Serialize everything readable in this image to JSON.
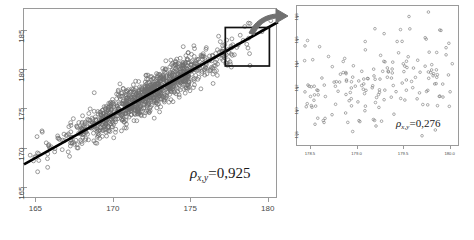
{
  "figure": {
    "title": "",
    "background": "#ffffff",
    "point_color": "#6e6e6e",
    "line_color": "#000000",
    "frame_color": "#9a9a9a",
    "arrow_color": "#707070",
    "highlight_color": "#111111"
  },
  "left_panel": {
    "name": "full-scatter-panel",
    "rho_symbol": "ρ",
    "rho_subscript": "x,y",
    "rho_equals": "=0,925",
    "x_ticks": [
      "165",
      "170",
      "175",
      "180"
    ],
    "y_ticks": [
      "165",
      "170",
      "175",
      "180",
      "185"
    ],
    "highlight_box": {
      "x0": 177.2,
      "x1": 180.0,
      "y0": 180.6,
      "y1": 185.4
    }
  },
  "right_panel": {
    "name": "zoomed-scatter-panel",
    "rho_symbol": "ρ",
    "rho_subscript": "x,y",
    "rho_equals": "=0,276",
    "x_ticks": [
      "178.5",
      "179.0",
      "179.5",
      "180.0"
    ],
    "y_ticks": [
      "178",
      "180",
      "182",
      "184",
      "186",
      "188"
    ]
  },
  "chart_data": [
    {
      "type": "scatter",
      "id": "left-full-scatter",
      "title": "",
      "xlabel": "",
      "ylabel": "",
      "xlim": [
        164.2,
        180.6
      ],
      "ylim": [
        163.6,
        187.8
      ],
      "xticks": [
        165,
        170,
        175,
        180
      ],
      "yticks": [
        165,
        170,
        175,
        180,
        185
      ],
      "grid": false,
      "legend": null,
      "correlation": 0.925,
      "n_points": 1100,
      "marker": "open-circle",
      "marker_size": 3.0,
      "point_color": "#6e6e6e",
      "regression_line": {
        "visible": true,
        "color": "#000000",
        "width": 2.6,
        "slope": 1.106,
        "intercept": -13.6,
        "x_from": 164.2,
        "x_to": 180.6
      },
      "annotations": [
        {
          "text": "ρx,y=0,925",
          "x": 178.4,
          "y": 165.6
        }
      ],
      "highlight_rect": {
        "x0": 177.2,
        "x1": 180.05,
        "y0": 180.55,
        "y1": 185.45
      },
      "scatter_model": {
        "x_mean": 172.2,
        "x_sd": 2.85,
        "y_from_x_slope": 1.106,
        "y_from_x_intercept": -13.6,
        "residual_sd": 1.12,
        "seed": 20240517
      }
    },
    {
      "type": "scatter",
      "id": "right-zoom-scatter",
      "title": "",
      "xlabel": "",
      "ylabel": "",
      "xlim": [
        178.35,
        180.1
      ],
      "ylim": [
        177.0,
        188.9
      ],
      "xticks": [
        178.5,
        179.0,
        179.5,
        180.0
      ],
      "yticks": [
        178,
        180,
        182,
        184,
        186,
        188
      ],
      "grid": false,
      "legend": null,
      "correlation": 0.276,
      "n_points": 175,
      "marker": "open-circle",
      "marker_size": 2.1,
      "point_color": "#7a7a7a",
      "regression_line": {
        "visible": false
      },
      "annotations": [
        {
          "text": "ρx,y=0,276",
          "x": 179.72,
          "y": 179.1
        }
      ],
      "scatter_model": {
        "x_min": 178.4,
        "x_max": 180.02,
        "y_mean": 182.6,
        "y_sd": 1.95,
        "corr": 0.276,
        "seed": 778811
      }
    }
  ],
  "arrow": {
    "name": "zoom-callout-arrow",
    "from": {
      "x": 250,
      "y": 30
    },
    "to": {
      "x": 288,
      "y": 14
    },
    "color": "#707070",
    "description": "curved arrow from highlight box to zoom panel"
  }
}
